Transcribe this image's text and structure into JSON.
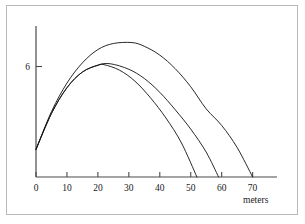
{
  "chart_data": {
    "type": "line",
    "title": "",
    "subtitle": "",
    "xlabel": "meters",
    "ylabel": "",
    "xlim": [
      0,
      74
    ],
    "ylim": [
      0,
      8.2
    ],
    "grid": false,
    "legend": null,
    "x_ticks": [
      0,
      10,
      20,
      30,
      40,
      50,
      60,
      70
    ],
    "x_tick_labels": [
      "0",
      "10",
      "20",
      "30",
      "40",
      "50",
      "60",
      "70"
    ],
    "y_ticks": [
      6
    ],
    "y_tick_labels": [
      "6"
    ],
    "annotations": [],
    "series": [
      {
        "name": "trajectory-long",
        "launch_height": 1.5,
        "peak_x": 31,
        "peak_y": 7.3,
        "landing_x": 70,
        "points": [
          {
            "x": 0,
            "y": 1.5
          },
          {
            "x": 5,
            "y": 3.55
          },
          {
            "x": 10,
            "y": 5.1
          },
          {
            "x": 15,
            "y": 6.2
          },
          {
            "x": 20,
            "y": 6.92
          },
          {
            "x": 25,
            "y": 7.25
          },
          {
            "x": 31,
            "y": 7.3
          },
          {
            "x": 35,
            "y": 7.1
          },
          {
            "x": 40,
            "y": 6.62
          },
          {
            "x": 45,
            "y": 5.88
          },
          {
            "x": 50,
            "y": 4.9
          },
          {
            "x": 55,
            "y": 3.7
          },
          {
            "x": 60,
            "y": 2.8
          },
          {
            "x": 65,
            "y": 1.6
          },
          {
            "x": 70,
            "y": 0
          }
        ]
      },
      {
        "name": "trajectory-medium",
        "launch_height": 1.5,
        "peak_x": 24,
        "peak_y": 6.15,
        "landing_x": 59,
        "points": [
          {
            "x": 0,
            "y": 1.5
          },
          {
            "x": 5,
            "y": 3.45
          },
          {
            "x": 10,
            "y": 4.85
          },
          {
            "x": 15,
            "y": 5.7
          },
          {
            "x": 20,
            "y": 6.08
          },
          {
            "x": 24,
            "y": 6.15
          },
          {
            "x": 30,
            "y": 5.85
          },
          {
            "x": 35,
            "y": 5.35
          },
          {
            "x": 40,
            "y": 4.6
          },
          {
            "x": 45,
            "y": 3.65
          },
          {
            "x": 50,
            "y": 2.6
          },
          {
            "x": 55,
            "y": 1.35
          },
          {
            "x": 59,
            "y": 0
          }
        ]
      },
      {
        "name": "trajectory-short",
        "launch_height": 1.5,
        "peak_x": 22,
        "peak_y": 6.1,
        "landing_x": 52,
        "points": [
          {
            "x": 0,
            "y": 1.5
          },
          {
            "x": 5,
            "y": 3.45
          },
          {
            "x": 10,
            "y": 4.85
          },
          {
            "x": 15,
            "y": 5.7
          },
          {
            "x": 20,
            "y": 6.06
          },
          {
            "x": 22,
            "y": 6.1
          },
          {
            "x": 27,
            "y": 5.8
          },
          {
            "x": 32,
            "y": 5.2
          },
          {
            "x": 37,
            "y": 4.3
          },
          {
            "x": 42,
            "y": 3.2
          },
          {
            "x": 47,
            "y": 1.85
          },
          {
            "x": 52,
            "y": 0
          }
        ]
      }
    ]
  },
  "colors": {
    "curve": "#111111",
    "axis": "#4a4a4a",
    "text": "#1a1a1a",
    "frame": "#b9b9b9",
    "background": "#ffffff"
  }
}
